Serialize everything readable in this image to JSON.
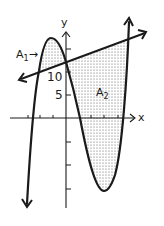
{
  "figure": {
    "axes": {
      "x_label": "x",
      "y_label": "y",
      "y_tick_labels": [
        "10",
        "5"
      ]
    },
    "regions": [
      {
        "name": "A",
        "subscript": "1",
        "arrow": "→",
        "description": "area between cubic and line, left of y-axis"
      },
      {
        "name": "A",
        "subscript": "2",
        "description": "area between line and cubic, right of y-axis"
      }
    ],
    "curves": [
      {
        "type": "line",
        "description": "line with positive slope crossing y-axis above 10"
      },
      {
        "type": "cubic",
        "description": "cubic with local max left of y-axis and local min right of y-axis"
      }
    ],
    "colors": {
      "stroke": "#1a1a1a",
      "fill_dots": "#555555",
      "background": "#ffffff"
    }
  }
}
